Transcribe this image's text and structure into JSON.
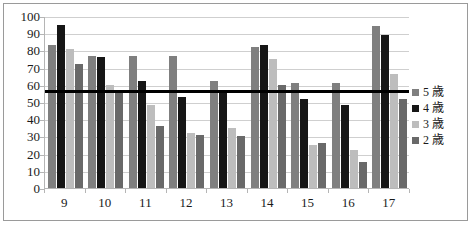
{
  "chart_data": {
    "type": "bar",
    "title": "",
    "subtitle": "",
    "xlabel": "",
    "ylabel": "",
    "ylim": [
      0,
      100
    ],
    "ytick_step": 10,
    "yticks": [
      100,
      90,
      80,
      70,
      60,
      50,
      40,
      30,
      20,
      10,
      0
    ],
    "grid": true,
    "legend_position": "right",
    "categories": [
      "9",
      "10",
      "11",
      "12",
      "13",
      "14",
      "15",
      "16",
      "17"
    ],
    "series": [
      {
        "name": "5 歳",
        "color": "#7f7f7f",
        "values": [
          83,
          77,
          77,
          77,
          62,
          82,
          61,
          61,
          94
        ]
      },
      {
        "name": "4 歳",
        "color": "#161616",
        "values": [
          95,
          76,
          62,
          53,
          57,
          83,
          52,
          48,
          89
        ]
      },
      {
        "name": "3 歳",
        "color": "#bdbdbd",
        "values": [
          81,
          60,
          48,
          32,
          35,
          75,
          25,
          22,
          66
        ]
      },
      {
        "name": "2 歳",
        "color": "#696969",
        "values": [
          72,
          56,
          36,
          31,
          30,
          60,
          26,
          15,
          52
        ]
      }
    ],
    "annotations": [
      {
        "type": "hline",
        "name": "threshold-line",
        "value": 57,
        "color": "#000000"
      }
    ]
  },
  "legend": {
    "items": [
      {
        "label": "5 歳",
        "color": "#7f7f7f"
      },
      {
        "label": "4 歳",
        "color": "#161616"
      },
      {
        "label": "3 歳",
        "color": "#bdbdbd"
      },
      {
        "label": "2 歳",
        "color": "#696969"
      }
    ]
  }
}
